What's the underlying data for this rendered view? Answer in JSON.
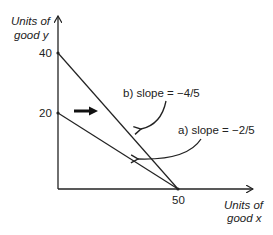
{
  "diagram": {
    "type": "budget-line",
    "y_axis": {
      "label_line1": "Units of",
      "label_line2": "good y"
    },
    "x_axis": {
      "label_line1": "Units of",
      "label_line2": "good x"
    },
    "ticks": {
      "y_high": "40",
      "y_low": "20",
      "x": "50"
    },
    "lines": [
      {
        "id": "a",
        "label": "a) slope = −2/5",
        "from": [
          0,
          20
        ],
        "to": [
          50,
          0
        ]
      },
      {
        "id": "b",
        "label": "b) slope = −4/5",
        "from": [
          0,
          40
        ],
        "to": [
          50,
          0
        ]
      }
    ],
    "shift_arrow": {
      "direction": "right",
      "meaning": "rotation outward"
    },
    "colors": {
      "line": "#222222",
      "background": "#ffffff"
    }
  }
}
